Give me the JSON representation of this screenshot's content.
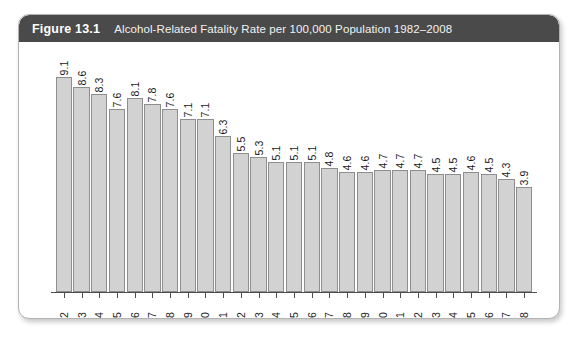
{
  "figure": {
    "number": "Figure 13.1",
    "title": "Alcohol-Related Fatality Rate per 100,000 Population 1982–2008",
    "header_bg": "#4a4a4a",
    "header_text_color": "#ffffff",
    "card_bg": "#ffffff",
    "card_border": "#b3b3b3"
  },
  "chart_data": {
    "type": "bar",
    "title": "Alcohol-Related Fatality Rate per 100,000 Population 1982–2008",
    "xlabel": "",
    "ylabel": "",
    "ylim": [
      0,
      9.6
    ],
    "grid": false,
    "legend": false,
    "bar_fill": "#d2d2d2",
    "bar_border": "#8e8e8e",
    "value_label_orientation": "vertical",
    "categories": [
      "1982",
      "1983",
      "1984",
      "1985",
      "1986",
      "1987",
      "1988",
      "1989",
      "1990",
      "1991",
      "1992",
      "1993",
      "1994",
      "1995",
      "1996",
      "1997",
      "1998",
      "1999",
      "2000",
      "2001",
      "2002",
      "2003",
      "2004",
      "2005",
      "2006",
      "2007",
      "2008"
    ],
    "values": [
      9.1,
      8.6,
      8.3,
      7.6,
      8.1,
      7.8,
      7.6,
      7.1,
      7.1,
      6.3,
      5.5,
      5.3,
      5.1,
      5.1,
      5.1,
      4.8,
      4.6,
      4.6,
      4.7,
      4.7,
      4.7,
      4.5,
      4.5,
      4.6,
      4.5,
      4.3,
      3.9
    ],
    "value_labels": [
      "9.1",
      "8.6",
      "8.3",
      "7.6",
      "8.1",
      "7.8",
      "7.6",
      "7.1",
      "7.1",
      "6.3",
      "5.5",
      "5.3",
      "5.1",
      "5.1",
      "5.1",
      "4.8",
      "4.6",
      "4.6",
      "4.7",
      "4.7",
      "4.7",
      "4.5",
      "4.5",
      "4.6",
      "4.5",
      "4.3",
      "3.9"
    ]
  }
}
